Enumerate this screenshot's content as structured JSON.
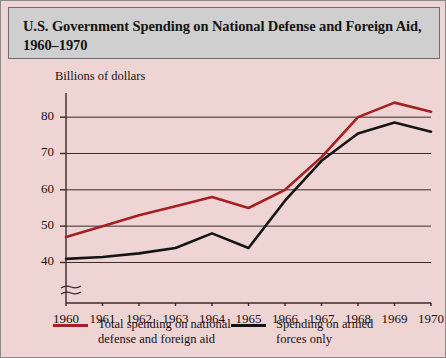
{
  "figure": {
    "title_line1": "U.S. Government Spending on National Defense and Foreign Aid,",
    "title_line2": "1960–1970",
    "background_color": "#eed5d4",
    "title_band_color": "#cfcfcf",
    "border_color": "#8a8a8a"
  },
  "chart_data": {
    "type": "line",
    "title": "U.S. Government Spending on National Defense and Foreign Aid, 1960–1970",
    "xlabel": "",
    "ylabel": "Billions of dollars",
    "categories": [
      "1960",
      "1961",
      "1962",
      "1963",
      "1964",
      "1965",
      "1966",
      "1967",
      "1968",
      "1969",
      "1970"
    ],
    "x": [
      1960,
      1961,
      1962,
      1963,
      1964,
      1965,
      1966,
      1967,
      1968,
      1969,
      1970
    ],
    "series": [
      {
        "name": "Total spending on national defense and foreign aid",
        "color": "#a32024",
        "values": [
          47,
          50,
          53,
          55.5,
          58,
          55,
          60,
          69,
          80,
          84,
          81.5
        ]
      },
      {
        "name": "Spending on armed forces only",
        "color": "#141414",
        "values": [
          41,
          41.5,
          42.5,
          44,
          48,
          44,
          57,
          68,
          75.5,
          78.5,
          76
        ]
      }
    ],
    "ylim": [
      36,
      85
    ],
    "yticks": [
      40,
      50,
      60,
      70,
      80
    ],
    "ytick_labels": [
      "40",
      "50",
      "60",
      "70",
      "80"
    ],
    "xlim": [
      1960,
      1970
    ],
    "grid": true,
    "grid_orientation": "horizontal",
    "axis_break": true,
    "axis_break_note": "y-axis broken below 40",
    "legend_position": "below-plot"
  },
  "legend": {
    "entries": [
      {
        "label_line1": "Total spending on national",
        "label_line2": "defense and foreign aid",
        "color": "#a32024"
      },
      {
        "label_line1": "Spending on armed",
        "label_line2": "forces only",
        "color": "#141414"
      }
    ]
  }
}
